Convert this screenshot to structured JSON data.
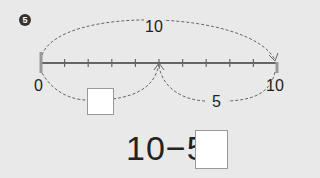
{
  "problem": {
    "number": "5",
    "number_line": {
      "start_label": "0",
      "end_label": "10",
      "ticks": 10
    },
    "top_arc_label": "10",
    "left_arc_answer_box": "",
    "right_arc_label": "5"
  },
  "equation": {
    "text": "10−5=",
    "answer_box": ""
  }
}
